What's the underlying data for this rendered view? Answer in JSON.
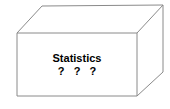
{
  "diagram": {
    "type": "black-box-cuboid",
    "background_color": "#ffffff",
    "line_color": "#8a8a8a",
    "text_color": "#000000",
    "front_face": {
      "labels": {
        "primary": "Statistics",
        "secondary": "? ? ?"
      }
    },
    "geometry": {
      "front_face_path": "M17,33 L137,33 L137,96 L17,96 Z",
      "top_face_path": "M17,33 L42,6 L163,5 L137,33 Z",
      "right_face_path": "M137,33 L163,5 L163,72 L137,96 Z",
      "vertices": {
        "front_top_left": "17,33",
        "front_top_right": "137,33",
        "front_bottom_right": "137,96",
        "front_bottom_left": "17,96",
        "back_top_left": "42,6",
        "back_top_right": "163,5",
        "back_bottom_right": "163,72"
      }
    }
  }
}
